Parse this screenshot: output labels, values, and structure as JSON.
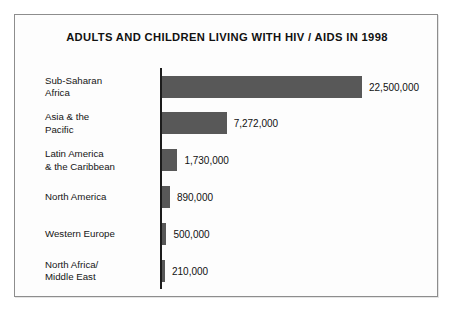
{
  "chart_data": {
    "type": "bar",
    "orientation": "horizontal",
    "title": "ADULTS AND CHILDREN LIVING WITH HIV / AIDS IN 1998",
    "xlabel": "",
    "ylabel": "",
    "grid": false,
    "legend": false,
    "xlim": [
      0,
      22500000
    ],
    "categories": [
      "Sub-Saharan\nAfrica",
      "Asia & the\nPacific",
      "Latin America\n& the Caribbean",
      "North America",
      "Western Europe",
      "North Africa/\nMiddle East"
    ],
    "values": [
      22500000,
      7272000,
      1730000,
      890000,
      500000,
      210000
    ],
    "value_labels": [
      "22,500,000",
      "7,272,000",
      "1,730,000",
      "890,000",
      "500,000",
      "210,000"
    ],
    "colors": {
      "bar": "#585858",
      "axis": "#1c1c1c",
      "frame": "#8d8d8d",
      "background": "#fdfdfd",
      "text": "#111111"
    }
  }
}
